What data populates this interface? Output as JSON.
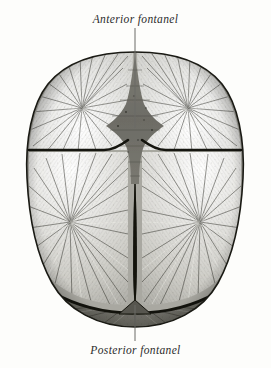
{
  "figure": {
    "background_color": "#fdfdfb",
    "ink_color": "#2b2b2b"
  },
  "labels": {
    "anterior": "Anterior fontanel",
    "posterior": "Posterior fontanel"
  },
  "leader_lines": {
    "anterior": {
      "x": 135,
      "y_top": 28,
      "y_bottom": 128
    },
    "posterior": {
      "x": 135,
      "y_top": 305,
      "y_bottom": 341
    }
  },
  "anatomy": {
    "outline": {
      "top_y": 52,
      "bottom_y": 327,
      "left_x": 30,
      "right_x": 241,
      "widest_y": 225
    },
    "bones": [
      {
        "name": "frontal-bone-left",
        "region": "upper-left"
      },
      {
        "name": "frontal-bone-right",
        "region": "upper-right"
      },
      {
        "name": "parietal-bone-left",
        "region": "lower-left"
      },
      {
        "name": "parietal-bone-right",
        "region": "lower-right"
      },
      {
        "name": "occipital-bone",
        "region": "bottom"
      }
    ],
    "sutures": [
      {
        "name": "metopic-suture",
        "orientation": "vertical-upper"
      },
      {
        "name": "coronal-suture",
        "orientation": "horizontal"
      },
      {
        "name": "sagittal-suture",
        "orientation": "vertical-lower"
      },
      {
        "name": "lambdoid-suture",
        "orientation": "horizontal-bottom"
      }
    ],
    "fontanels": [
      {
        "name": "anterior-fontanel",
        "shape": "diamond",
        "cx": 135,
        "cy": 118
      },
      {
        "name": "posterior-fontanel",
        "shape": "triangle",
        "cx": 135,
        "cy": 312
      }
    ]
  }
}
